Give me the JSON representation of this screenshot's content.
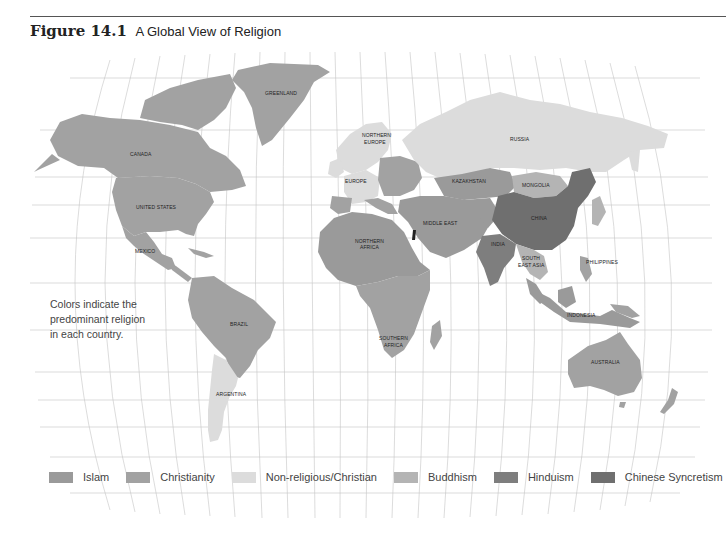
{
  "figure": {
    "number": "Figure 14.1",
    "title": "A Global View of Religion"
  },
  "note": {
    "line1": "Colors indicate the",
    "line2": "predominant religion",
    "line3": "in each country."
  },
  "colors": {
    "islam": "#9a9a9a",
    "christianity": "#a2a2a2",
    "nonreligious_christian": "#dcdcdc",
    "buddhism": "#b4b4b4",
    "hinduism": "#7e7e7e",
    "chinese_syncretism": "#6f6f6f",
    "grid": "#bdbdbd"
  },
  "legend": [
    {
      "label": "Islam",
      "color": "#9a9a9a"
    },
    {
      "label": "Christianity",
      "color": "#a2a2a2"
    },
    {
      "label": "Non-religious/Christian",
      "color": "#dcdcdc"
    },
    {
      "label": "Buddhism",
      "color": "#b4b4b4"
    },
    {
      "label": "Hinduism",
      "color": "#7e7e7e"
    },
    {
      "label": "Chinese Syncretism",
      "color": "#6f6f6f"
    }
  ],
  "regions": {
    "greenland": "GREENLAND",
    "canada": "CANADA",
    "united_states": "UNITED STATES",
    "mexico": "MEXICO",
    "brazil": "BRAZIL",
    "argentina": "ARGENTINA",
    "northern_europe_1": "NORTHERN",
    "northern_europe_2": "EUROPE",
    "europe": "EUROPE",
    "russia": "RUSSIA",
    "kazakhstan": "KAZAKHSTAN",
    "mongolia": "MONGOLIA",
    "china": "CHINA",
    "middle_east": "MIDDLE EAST",
    "northern_africa_1": "NORTHERN",
    "northern_africa_2": "AFRICA",
    "india": "INDIA",
    "south_east_asia_1": "SOUTH",
    "south_east_asia_2": "EAST ASIA",
    "philippines": "PHILIPPINES",
    "indonesia": "INDONESIA",
    "southern_africa_1": "SOUTHERN",
    "southern_africa_2": "AFRICA",
    "australia": "AUSTRALIA"
  }
}
